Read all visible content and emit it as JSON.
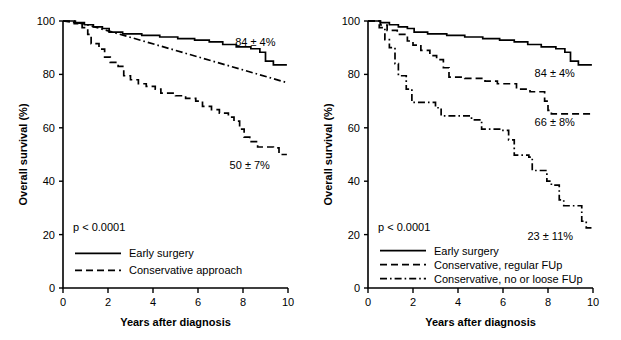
{
  "figure": {
    "type": "kaplan-meier-survival-figure",
    "panel_count": 2,
    "background_color": "#ffffff",
    "line_color": "#000000"
  },
  "chart_data": [
    {
      "type": "line",
      "panel": "left",
      "title": "",
      "xlabel": "Years after diagnosis",
      "ylabel": "Overall survival (%)",
      "xlim": [
        0,
        10
      ],
      "ylim": [
        0,
        100
      ],
      "xticks": [
        0,
        2,
        4,
        6,
        8,
        10
      ],
      "yticks": [
        0,
        20,
        40,
        60,
        80,
        100
      ],
      "xtick_labels": [
        "0",
        "2",
        "4",
        "6",
        "8",
        "10"
      ],
      "ytick_labels": [
        "0",
        "20",
        "40",
        "60",
        "80",
        "100"
      ],
      "grid": false,
      "legend_position": "lower-left",
      "pvalue": "p < 0.0001",
      "annotations": [
        {
          "text": "84 ± 4%",
          "x": 8.55,
          "y": 90.5
        },
        {
          "text": "50 ± 7%",
          "x": 8.3,
          "y": 44.5
        }
      ],
      "series": [
        {
          "name": "Early surgery",
          "style": "solid",
          "in_legend": true,
          "end_value": "84 ± 4%",
          "points": [
            [
              0,
              100
            ],
            [
              0.55,
              100
            ],
            [
              0.55,
              99.4
            ],
            [
              0.95,
              99.4
            ],
            [
              0.95,
              98.6
            ],
            [
              1.35,
              98.6
            ],
            [
              1.35,
              97.8
            ],
            [
              1.75,
              97.8
            ],
            [
              1.75,
              97.2
            ],
            [
              2.05,
              97.2
            ],
            [
              2.05,
              95.8
            ],
            [
              2.65,
              95.8
            ],
            [
              2.65,
              95.2
            ],
            [
              3.5,
              95.2
            ],
            [
              3.5,
              94.6
            ],
            [
              4.3,
              94.6
            ],
            [
              4.3,
              94.0
            ],
            [
              5.1,
              94.0
            ],
            [
              5.1,
              93.4
            ],
            [
              5.85,
              93.4
            ],
            [
              5.85,
              92.8
            ],
            [
              6.5,
              92.8
            ],
            [
              6.5,
              92.2
            ],
            [
              7.1,
              92.2
            ],
            [
              7.1,
              91.2
            ],
            [
              7.7,
              91.2
            ],
            [
              7.7,
              90.3
            ],
            [
              8.35,
              90.3
            ],
            [
              8.35,
              89.6
            ],
            [
              8.75,
              89.6
            ],
            [
              8.75,
              88.3
            ],
            [
              9.0,
              88.3
            ],
            [
              9.0,
              85.0
            ],
            [
              9.35,
              85.0
            ],
            [
              9.35,
              83.6
            ],
            [
              9.95,
              83.6
            ]
          ]
        },
        {
          "name": "Conservative approach",
          "style": "dashed",
          "in_legend": true,
          "end_value": "50 ± 7%",
          "points": [
            [
              0,
              100
            ],
            [
              0.5,
              100
            ],
            [
              0.5,
              99.0
            ],
            [
              0.85,
              99.0
            ],
            [
              0.85,
              97.5
            ],
            [
              1.1,
              97.5
            ],
            [
              1.1,
              95.0
            ],
            [
              1.25,
              95.0
            ],
            [
              1.25,
              91.5
            ],
            [
              1.6,
              91.5
            ],
            [
              1.6,
              89.5
            ],
            [
              1.85,
              89.5
            ],
            [
              1.85,
              86.5
            ],
            [
              2.1,
              86.5
            ],
            [
              2.1,
              84.5
            ],
            [
              2.45,
              84.5
            ],
            [
              2.45,
              83.0
            ],
            [
              2.7,
              83.0
            ],
            [
              2.7,
              79.5
            ],
            [
              3.0,
              79.5
            ],
            [
              3.0,
              78.0
            ],
            [
              3.35,
              78.0
            ],
            [
              3.35,
              76.5
            ],
            [
              3.7,
              76.5
            ],
            [
              3.7,
              75.5
            ],
            [
              4.1,
              75.5
            ],
            [
              4.1,
              74.5
            ],
            [
              4.35,
              74.5
            ],
            [
              4.35,
              73.0
            ],
            [
              5.0,
              73.0
            ],
            [
              5.0,
              72.0
            ],
            [
              5.45,
              72.0
            ],
            [
              5.45,
              71.0
            ],
            [
              5.9,
              71.0
            ],
            [
              5.9,
              70.0
            ],
            [
              6.2,
              70.0
            ],
            [
              6.2,
              68.0
            ],
            [
              6.6,
              68.0
            ],
            [
              6.6,
              66.8
            ],
            [
              6.95,
              66.8
            ],
            [
              6.95,
              65.5
            ],
            [
              7.35,
              65.5
            ],
            [
              7.35,
              64.0
            ],
            [
              7.6,
              64.0
            ],
            [
              7.6,
              62.5
            ],
            [
              7.85,
              62.5
            ],
            [
              7.85,
              59.5
            ],
            [
              8.05,
              59.5
            ],
            [
              8.05,
              56.5
            ],
            [
              8.3,
              56.5
            ],
            [
              8.3,
              54.8
            ],
            [
              8.65,
              54.8
            ],
            [
              8.65,
              52.8
            ],
            [
              9.35,
              52.8
            ],
            [
              9.35,
              52.5
            ],
            [
              9.6,
              52.5
            ],
            [
              9.6,
              50.0
            ],
            [
              9.95,
              50.0
            ]
          ]
        },
        {
          "name": "",
          "style": "dashdot",
          "in_legend": false,
          "end_value": "",
          "points": [
            [
              0,
              100
            ],
            [
              0.9,
              99.0
            ],
            [
              10,
              76.8
            ]
          ]
        }
      ],
      "legend": [
        {
          "label": "Early surgery",
          "style": "solid"
        },
        {
          "label": "Conservative approach",
          "style": "dashed"
        }
      ]
    },
    {
      "type": "line",
      "panel": "right",
      "title": "",
      "xlabel": "Years after diagnosis",
      "ylabel": "Overall survival (%)",
      "xlim": [
        0,
        10
      ],
      "ylim": [
        0,
        100
      ],
      "xticks": [
        0,
        2,
        4,
        6,
        8,
        10
      ],
      "yticks": [
        0,
        20,
        40,
        60,
        80,
        100
      ],
      "xtick_labels": [
        "0",
        "2",
        "4",
        "6",
        "8",
        "10"
      ],
      "ytick_labels": [
        "0",
        "20",
        "40",
        "60",
        "80",
        "100"
      ],
      "grid": false,
      "legend_position": "lower-left",
      "pvalue": "p < 0.0001",
      "annotations": [
        {
          "text": "84 ± 4%",
          "x": 8.3,
          "y": 79.0
        },
        {
          "text": "66 ± 8%",
          "x": 8.3,
          "y": 60.5
        },
        {
          "text": "23 ± 11%",
          "x": 8.1,
          "y": 18.0
        }
      ],
      "series": [
        {
          "name": "Early surgery",
          "style": "solid",
          "in_legend": true,
          "end_value": "84 ± 4%",
          "points": [
            [
              0,
              100
            ],
            [
              0.55,
              100
            ],
            [
              0.55,
              99.4
            ],
            [
              0.95,
              99.4
            ],
            [
              0.95,
              98.6
            ],
            [
              1.35,
              98.6
            ],
            [
              1.35,
              97.8
            ],
            [
              1.75,
              97.8
            ],
            [
              1.75,
              97.2
            ],
            [
              2.05,
              97.2
            ],
            [
              2.05,
              95.8
            ],
            [
              2.65,
              95.8
            ],
            [
              2.65,
              95.2
            ],
            [
              3.5,
              95.2
            ],
            [
              3.5,
              94.6
            ],
            [
              4.3,
              94.6
            ],
            [
              4.3,
              94.0
            ],
            [
              5.1,
              94.0
            ],
            [
              5.1,
              93.4
            ],
            [
              5.85,
              93.4
            ],
            [
              5.85,
              92.8
            ],
            [
              6.5,
              92.8
            ],
            [
              6.5,
              92.2
            ],
            [
              7.1,
              92.2
            ],
            [
              7.1,
              91.2
            ],
            [
              7.7,
              91.2
            ],
            [
              7.7,
              90.3
            ],
            [
              8.35,
              90.3
            ],
            [
              8.35,
              89.6
            ],
            [
              8.75,
              89.6
            ],
            [
              8.75,
              88.3
            ],
            [
              9.0,
              88.3
            ],
            [
              9.0,
              85.0
            ],
            [
              9.35,
              85.0
            ],
            [
              9.35,
              83.6
            ],
            [
              9.95,
              83.6
            ]
          ]
        },
        {
          "name": "Conservative, regular FUp",
          "style": "dashed",
          "in_legend": true,
          "end_value": "66 ± 8%",
          "points": [
            [
              0,
              100
            ],
            [
              0.55,
              100
            ],
            [
              0.55,
              98.5
            ],
            [
              0.85,
              98.5
            ],
            [
              0.85,
              96.5
            ],
            [
              1.3,
              96.5
            ],
            [
              1.3,
              95.0
            ],
            [
              1.75,
              95.0
            ],
            [
              1.75,
              92.5
            ],
            [
              2.0,
              92.5
            ],
            [
              2.0,
              91.0
            ],
            [
              2.35,
              91.0
            ],
            [
              2.35,
              89.0
            ],
            [
              2.75,
              89.0
            ],
            [
              2.75,
              87.0
            ],
            [
              3.05,
              87.0
            ],
            [
              3.05,
              85.5
            ],
            [
              3.35,
              85.5
            ],
            [
              3.35,
              82.5
            ],
            [
              3.6,
              82.5
            ],
            [
              3.6,
              79.0
            ],
            [
              4.3,
              79.0
            ],
            [
              4.3,
              78.5
            ],
            [
              5.2,
              78.5
            ],
            [
              5.2,
              77.5
            ],
            [
              5.75,
              77.5
            ],
            [
              5.75,
              76.5
            ],
            [
              6.6,
              76.5
            ],
            [
              6.6,
              74.5
            ],
            [
              7.2,
              74.5
            ],
            [
              7.2,
              73.5
            ],
            [
              7.85,
              73.5
            ],
            [
              7.85,
              70.0
            ],
            [
              8.0,
              70.0
            ],
            [
              8.0,
              66.5
            ],
            [
              8.15,
              66.5
            ],
            [
              8.15,
              65.2
            ],
            [
              9.95,
              65.2
            ]
          ]
        },
        {
          "name": "Conservative, no or loose FUp",
          "style": "dashdot",
          "in_legend": true,
          "end_value": "23 ± 11%",
          "points": [
            [
              0,
              100
            ],
            [
              0.5,
              100
            ],
            [
              0.5,
              97.5
            ],
            [
              0.75,
              97.5
            ],
            [
              0.75,
              93.0
            ],
            [
              0.95,
              93.0
            ],
            [
              0.95,
              90.0
            ],
            [
              1.2,
              90.0
            ],
            [
              1.2,
              84.0
            ],
            [
              1.35,
              84.0
            ],
            [
              1.35,
              79.5
            ],
            [
              1.7,
              79.5
            ],
            [
              1.7,
              74.5
            ],
            [
              1.95,
              74.5
            ],
            [
              1.95,
              69.5
            ],
            [
              3.0,
              69.5
            ],
            [
              3.0,
              67.5
            ],
            [
              3.25,
              67.5
            ],
            [
              3.25,
              64.5
            ],
            [
              4.6,
              64.5
            ],
            [
              4.6,
              63.0
            ],
            [
              5.05,
              63.0
            ],
            [
              5.05,
              59.5
            ],
            [
              5.95,
              59.5
            ],
            [
              5.95,
              59.0
            ],
            [
              6.25,
              59.0
            ],
            [
              6.25,
              55.5
            ],
            [
              6.5,
              55.5
            ],
            [
              6.5,
              49.8
            ],
            [
              7.15,
              49.8
            ],
            [
              7.15,
              49.0
            ],
            [
              7.3,
              49.0
            ],
            [
              7.3,
              44.0
            ],
            [
              7.95,
              44.0
            ],
            [
              7.95,
              40.0
            ],
            [
              8.15,
              40.0
            ],
            [
              8.15,
              38.5
            ],
            [
              8.5,
              38.5
            ],
            [
              8.5,
              33.0
            ],
            [
              8.7,
              33.0
            ],
            [
              8.7,
              30.8
            ],
            [
              9.5,
              30.8
            ],
            [
              9.5,
              25.0
            ],
            [
              9.7,
              25.0
            ],
            [
              9.7,
              22.5
            ],
            [
              9.95,
              22.5
            ]
          ]
        }
      ],
      "legend": [
        {
          "label": "Early surgery",
          "style": "solid"
        },
        {
          "label": "Conservative, regular FUp",
          "style": "dashed"
        },
        {
          "label": "Conservative, no or loose FUp",
          "style": "dashdot"
        }
      ]
    }
  ]
}
